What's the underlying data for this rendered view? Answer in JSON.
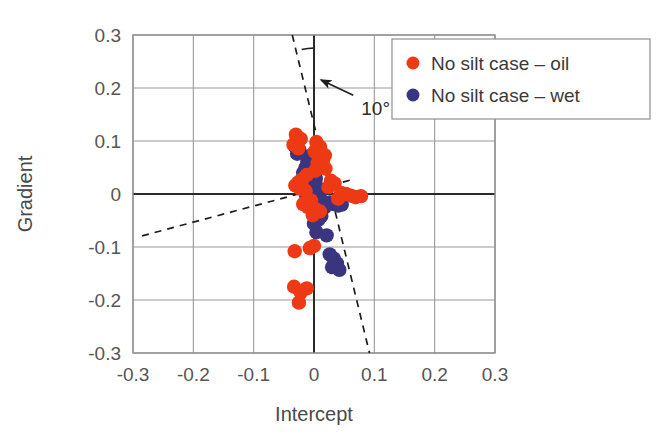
{
  "chart_data": {
    "type": "scatter",
    "title": "",
    "xlabel": "Intercept",
    "ylabel": "Gradient",
    "xlim": [
      -0.3,
      0.3
    ],
    "ylim": [
      -0.3,
      0.3
    ],
    "xticks": [
      -0.3,
      -0.2,
      -0.1,
      0,
      0.1,
      0.2,
      0.3
    ],
    "yticks": [
      -0.3,
      -0.2,
      -0.1,
      0,
      0.1,
      0.2,
      0.3
    ],
    "xtick_labels": [
      "-0.3",
      "-0.2",
      "-0.1",
      "0",
      "0.1",
      "0.2",
      "0.3"
    ],
    "ytick_labels": [
      "0.3",
      "0.2",
      "0.1",
      "0",
      "-0.1",
      "-0.2",
      "-0.3"
    ],
    "grid": true,
    "legend_position": "top-right",
    "annotations": [
      {
        "text": "10°",
        "x": 0.075,
        "y": 0.175,
        "kind": "angle-between-vertical-axis-and-steep-trend-line"
      }
    ],
    "reference_lines": [
      {
        "name": "steep-dashed-trend-line",
        "style": "dashed",
        "x0": -0.036,
        "y0": 0.3,
        "x1": 0.092,
        "y1": -0.3
      },
      {
        "name": "shallow-dashed-trend-line",
        "style": "dashed",
        "x0": -0.285,
        "y0": -0.079,
        "x1": 0.063,
        "y1": 0.027
      }
    ],
    "series": [
      {
        "name": "No silt case  – oil",
        "color": "#EE3A14",
        "marker": "circle",
        "points": [
          [
            -0.03,
            0.112
          ],
          [
            -0.022,
            0.104
          ],
          [
            -0.034,
            0.093
          ],
          [
            -0.026,
            0.086
          ],
          [
            0.004,
            0.098
          ],
          [
            0.01,
            0.089
          ],
          [
            0.001,
            0.08
          ],
          [
            0.013,
            0.077
          ],
          [
            0.018,
            0.073
          ],
          [
            0.008,
            0.068
          ],
          [
            0.015,
            0.063
          ],
          [
            0.006,
            0.058
          ],
          [
            0.012,
            0.052
          ],
          [
            0.019,
            0.048
          ],
          [
            0.002,
            0.044
          ],
          [
            -0.012,
            0.036
          ],
          [
            -0.019,
            0.028
          ],
          [
            -0.026,
            0.022
          ],
          [
            -0.031,
            0.016
          ],
          [
            -0.023,
            0.01
          ],
          [
            -0.014,
            0.006
          ],
          [
            0.028,
            0.025
          ],
          [
            0.034,
            0.02
          ],
          [
            0.024,
            0.013
          ],
          [
            0.045,
            0.002
          ],
          [
            0.053,
            0.0
          ],
          [
            0.061,
            -0.003
          ],
          [
            0.069,
            -0.006
          ],
          [
            0.078,
            -0.004
          ],
          [
            0.04,
            -0.009
          ],
          [
            -0.005,
            -0.012
          ],
          [
            -0.018,
            -0.019
          ],
          [
            -0.01,
            -0.025
          ],
          [
            0.002,
            -0.028
          ],
          [
            0.01,
            -0.033
          ],
          [
            -0.002,
            -0.04
          ],
          [
            -0.032,
            -0.108
          ],
          [
            -0.007,
            -0.102
          ],
          [
            0.0,
            -0.098
          ],
          [
            -0.033,
            -0.175
          ],
          [
            -0.012,
            -0.178
          ],
          [
            -0.022,
            -0.186
          ],
          [
            -0.025,
            -0.205
          ]
        ]
      },
      {
        "name": "No silt case  – wet",
        "color": "#3B3580",
        "marker": "circle",
        "points": [
          [
            -0.031,
            0.089
          ],
          [
            -0.024,
            0.083
          ],
          [
            -0.028,
            0.076
          ],
          [
            -0.006,
            0.072
          ],
          [
            0.0,
            0.066
          ],
          [
            -0.011,
            0.062
          ],
          [
            -0.004,
            0.057
          ],
          [
            0.006,
            0.054
          ],
          [
            -0.014,
            0.05
          ],
          [
            -0.008,
            0.046
          ],
          [
            0.001,
            0.042
          ],
          [
            -0.018,
            0.04
          ],
          [
            -0.012,
            0.035
          ],
          [
            -0.005,
            0.032
          ],
          [
            0.003,
            0.029
          ],
          [
            -0.021,
            0.026
          ],
          [
            -0.015,
            0.022
          ],
          [
            -0.009,
            0.019
          ],
          [
            -0.002,
            0.016
          ],
          [
            0.005,
            0.013
          ],
          [
            -0.017,
            0.011
          ],
          [
            -0.011,
            0.008
          ],
          [
            -0.004,
            0.005
          ],
          [
            0.002,
            0.002
          ],
          [
            0.008,
            0.0
          ],
          [
            -0.013,
            -0.003
          ],
          [
            -0.007,
            -0.006
          ],
          [
            -0.001,
            -0.009
          ],
          [
            0.005,
            -0.012
          ],
          [
            0.011,
            -0.01
          ],
          [
            0.026,
            -0.016
          ],
          [
            0.033,
            -0.019
          ],
          [
            0.04,
            -0.022
          ],
          [
            0.046,
            -0.02
          ],
          [
            0.017,
            -0.026
          ],
          [
            0.01,
            -0.031
          ],
          [
            0.004,
            -0.036
          ],
          [
            0.012,
            -0.042
          ],
          [
            0.007,
            -0.049
          ],
          [
            0.0,
            -0.056
          ],
          [
            0.004,
            -0.072
          ],
          [
            0.021,
            -0.078
          ],
          [
            0.026,
            -0.114
          ],
          [
            0.033,
            -0.122
          ],
          [
            0.038,
            -0.131
          ],
          [
            0.03,
            -0.138
          ],
          [
            0.042,
            -0.143
          ]
        ]
      }
    ]
  },
  "legend": {
    "entries": [
      {
        "label": "No silt case  – oil",
        "color": "#EE3A14"
      },
      {
        "label": "No silt case  – wet",
        "color": "#3B3580"
      }
    ]
  },
  "colors": {
    "oil": "#EE3A14",
    "wet": "#3B3580",
    "grid": "#9a9a9a",
    "frame": "#8f8f8f",
    "axis": "#2a2a2a",
    "text": "#4a4a4a"
  }
}
